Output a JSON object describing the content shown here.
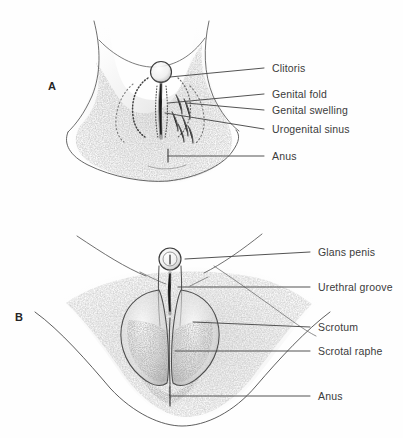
{
  "figure": {
    "background_color": "#fefefe",
    "ink_color": "#4a4a4a",
    "text_color": "#3b3b3b",
    "stipple_color": "#8f8f8f",
    "width": 403,
    "height": 438
  },
  "panels": [
    {
      "id": "panel-a",
      "letter": "A",
      "caption": "Female external genitalia (indifferent / feminizing stage)",
      "labels": [
        {
          "key": "clitoris",
          "text": "Clitoris",
          "text_x": 272,
          "text_y": 62,
          "line_x1": 264,
          "line_y1": 68,
          "line_x2": 170,
          "line_y2": 77
        },
        {
          "key": "genital_fold",
          "text": "Genital fold",
          "text_x": 272,
          "text_y": 88,
          "line_x1": 264,
          "line_y1": 94,
          "line_x2": 168,
          "line_y2": 103
        },
        {
          "key": "genital_swelling",
          "text": "Genital swelling",
          "text_x": 272,
          "text_y": 104,
          "line_x1": 264,
          "line_y1": 110,
          "line_x2": 186,
          "line_y2": 103
        },
        {
          "key": "urogenital_sinus",
          "text": "Urogenital sinus",
          "text_x": 272,
          "text_y": 123,
          "line_x1": 264,
          "line_y1": 129,
          "line_x2": 165,
          "line_y2": 113
        },
        {
          "key": "anus",
          "text": "Anus",
          "text_x": 272,
          "text_y": 150,
          "line_x1": 264,
          "line_y1": 156,
          "line_x2": 168,
          "line_y2": 156
        }
      ]
    },
    {
      "id": "panel-b",
      "letter": "B",
      "caption": "Male external genitalia (masculinizing stage)",
      "labels": [
        {
          "key": "glans_penis",
          "text": "Glans penis",
          "text_x": 318,
          "text_y": 246,
          "line_x1": 310,
          "line_y1": 252,
          "line_x2": 185,
          "line_y2": 259
        },
        {
          "key": "urethral_groove",
          "text": "Urethral groove",
          "text_x": 318,
          "text_y": 281,
          "line_x1": 310,
          "line_y1": 287,
          "line_x2": 178,
          "line_y2": 287
        },
        {
          "key": "scrotum",
          "text": "Scrotum",
          "text_x": 318,
          "text_y": 321,
          "line_x1": 310,
          "line_y1": 327,
          "line_x2": 193,
          "line_y2": 322
        },
        {
          "key": "scrotal_raphe",
          "text": "Scrotal raphe",
          "text_x": 318,
          "text_y": 345,
          "line_x1": 310,
          "line_y1": 351,
          "line_x2": 175,
          "line_y2": 351
        },
        {
          "key": "anus",
          "text": "Anus",
          "text_x": 318,
          "text_y": 390,
          "line_x1": 310,
          "line_y1": 396,
          "line_x2": 170,
          "line_y2": 396
        }
      ]
    }
  ]
}
